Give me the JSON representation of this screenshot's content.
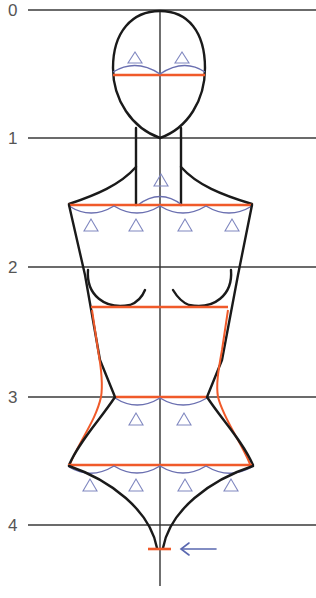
{
  "figure": {
    "unit_labels": [
      "0",
      "1",
      "2",
      "3",
      "4"
    ],
    "colors": {
      "grid": "#3a3a3a",
      "outline": "#1a1a1a",
      "measure_line": "#f05a2a",
      "arc": "#6a6fb0",
      "triangle": "#8088c0",
      "arrow": "#5a68b0"
    },
    "measure_lines": [
      "eye-line",
      "shoulder-line",
      "bust-line",
      "waist-line",
      "hip-line",
      "crotch-mark"
    ],
    "triangle_groups": {
      "head": 2,
      "neck": 1,
      "shoulders": 4,
      "waist": 2,
      "hips": 4
    },
    "arrow": "left-arrow"
  }
}
